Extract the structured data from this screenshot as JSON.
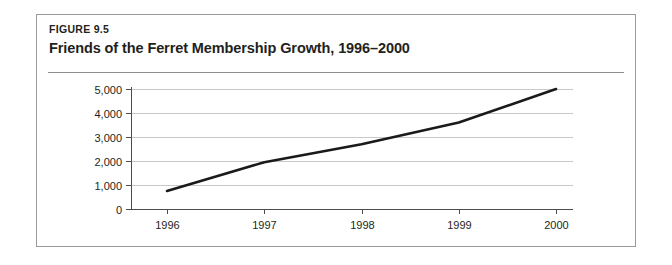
{
  "figure": {
    "label": "FIGURE 9.5",
    "title": "Friends of the Ferret Membership Growth, 1996–2000"
  },
  "colors": {
    "line": "#1a1a1a",
    "gridline": "#c9c9c9",
    "axis": "#4c4c4c",
    "border": "#9a9a9a",
    "text": "#231f20",
    "background": "#ffffff"
  },
  "chart_data": {
    "type": "line",
    "title": "Friends of the Ferret Membership Growth, 1996–2000",
    "subtitle": "FIGURE 9.5",
    "xlabel": "",
    "ylabel": "",
    "x": [
      "1996",
      "1997",
      "1998",
      "1999",
      "2000"
    ],
    "categories": [
      "1996",
      "1997",
      "1998",
      "1999",
      "2000"
    ],
    "values": [
      750,
      1950,
      2700,
      3600,
      5000
    ],
    "series": [
      {
        "name": "Membership",
        "values": [
          750,
          1950,
          2700,
          3600,
          5000
        ]
      }
    ],
    "ylim": [
      0,
      5000
    ],
    "ytick_labels": [
      "0",
      "1,000",
      "2,000",
      "3,000",
      "4,000",
      "5,000"
    ],
    "ytick_values": [
      0,
      1000,
      2000,
      3000,
      4000,
      5000
    ],
    "xtick_labels": [
      "1996",
      "1997",
      "1998",
      "1999",
      "2000"
    ],
    "grid": true,
    "grid_axis": "y",
    "legend": false,
    "legend_position": "none",
    "markers": false
  }
}
